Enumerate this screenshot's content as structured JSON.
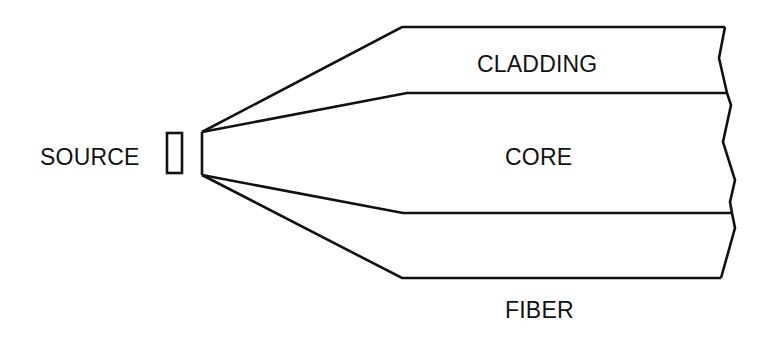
{
  "diagram": {
    "type": "optical-fiber-coupling",
    "labels": {
      "source": "SOURCE",
      "cladding": "CLADDING",
      "core": "CORE",
      "fiber": "FIBER"
    },
    "colors": {
      "line": "#111111",
      "background": "#ffffff"
    }
  }
}
